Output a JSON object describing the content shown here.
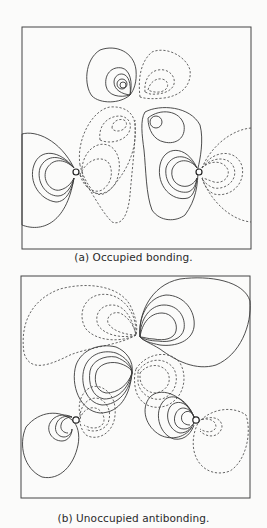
{
  "figure": {
    "panels": [
      {
        "id": "a",
        "caption": "(a) Occupied bonding.",
        "legend_conventions": {
          "solid_lines": "positive contours",
          "dashed_lines": "negative contours"
        },
        "nuclei": 2
      },
      {
        "id": "b",
        "caption": "(b) Unoccupied antibonding.",
        "legend_conventions": {
          "solid_lines": "positive contours",
          "dashed_lines": "negative contours"
        },
        "nuclei": 2
      }
    ]
  },
  "colors": {
    "background": "#fbfbfa",
    "line": "#3a3a3a"
  }
}
